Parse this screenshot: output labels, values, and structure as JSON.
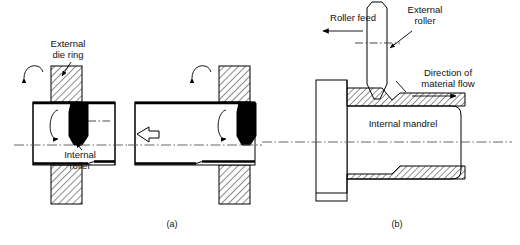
{
  "figure": {
    "panels": [
      {
        "id": "a",
        "caption": "(a)",
        "labels": [
          {
            "name": "external-die-ring",
            "text_line1": "External",
            "text_line2": "die ring"
          },
          {
            "name": "internal-roller",
            "text_line1": "Internal",
            "text_line2": "roller"
          }
        ]
      },
      {
        "id": "b",
        "caption": "(b)",
        "labels": [
          {
            "name": "roller-feed",
            "text_line1": "Roller feed",
            "text_line2": ""
          },
          {
            "name": "external-roller",
            "text_line1": "External",
            "text_line2": "roller"
          },
          {
            "name": "direction-of-material-flow",
            "text_line1": "Direction of",
            "text_line2": "material flow"
          },
          {
            "name": "internal-mandrel",
            "text_line1": "Internal mandrel",
            "text_line2": ""
          }
        ]
      }
    ],
    "colors": {
      "line": "#000000",
      "centerline": "#555555",
      "fill_solid": "#000000",
      "background": "#ffffff",
      "text": "#111111"
    }
  },
  "panel_a": {
    "caption": "(a)",
    "external_die_ring_label_l1": "External",
    "external_die_ring_label_l2": "die ring",
    "internal_roller_label_l1": "Internal",
    "internal_roller_label_l2": "roller"
  },
  "panel_b": {
    "caption": "(b)",
    "roller_feed_label": "Roller feed",
    "external_roller_label_l1": "External",
    "external_roller_label_l2": "roller",
    "material_flow_label_l1": "Direction of",
    "material_flow_label_l2": "material flow",
    "internal_mandrel_label": "Internal mandrel"
  }
}
